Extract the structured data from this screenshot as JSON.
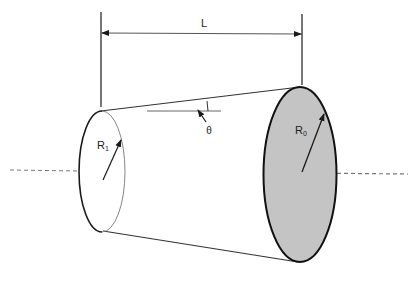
{
  "diagram": {
    "labels": {
      "length": "L",
      "radius_small": "R",
      "radius_small_sub": "1",
      "radius_large": "R",
      "radius_large_sub": "0",
      "angle": "θ"
    },
    "colors": {
      "stroke": "#1a1a1a",
      "thin_stroke": "#555555",
      "fill_large_face": "#c4c4c4",
      "dashed_axis": "#666666",
      "background": "#ffffff"
    }
  }
}
